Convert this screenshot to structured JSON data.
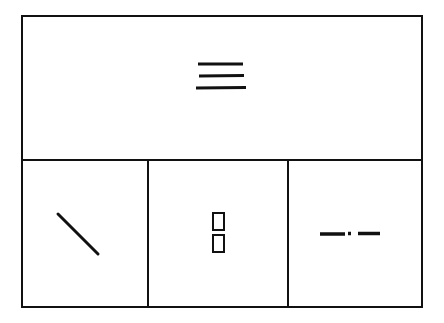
{
  "diagram": {
    "type": "symbol-grid",
    "stroke_color": "#111111",
    "background_color": "#ffffff",
    "panels": [
      {
        "position": "top",
        "symbol": "three-horizontal-lines"
      },
      {
        "position": "bottom-left",
        "symbol": "diagonal-line"
      },
      {
        "position": "bottom-middle",
        "symbol": "two-stacked-rectangles"
      },
      {
        "position": "bottom-right",
        "symbol": "dash-dot-line"
      }
    ]
  }
}
